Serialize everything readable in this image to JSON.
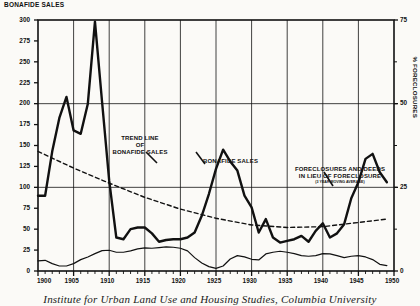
{
  "titles": {
    "left_axis": "BONAFIDE SALES",
    "right_axis": "% FORECLOSURES",
    "caption": "Institute for Urban Land Use and Housing Studies, Columbia University"
  },
  "annotations": {
    "trend_l1": "TREND LINE",
    "trend_l2": "OF",
    "trend_l3": "BONAFIDE SALES",
    "sales": "BONAFIDE SALES",
    "fore_l1": "FORECLOSURES AND DEEDS",
    "fore_l2": "IN LIEU OF FORECLOSURE",
    "fore_l3": "(3 YEAR MOVING AVERAGE)"
  },
  "chart_data": {
    "type": "line",
    "title": "",
    "xlabel": "",
    "ylabel": "BONAFIDE SALES",
    "y2label": "% FORECLOSURES",
    "xlim": [
      1900,
      1950
    ],
    "ylim": [
      0,
      300
    ],
    "y2lim": [
      0,
      75
    ],
    "grid": true,
    "legend": "annotations",
    "xticks": [
      1900,
      1905,
      1910,
      1915,
      1920,
      1925,
      1930,
      1935,
      1940,
      1945,
      1950
    ],
    "yticks": [
      0,
      25,
      50,
      75,
      100,
      125,
      150,
      175,
      200,
      225,
      250,
      275,
      300
    ],
    "y2ticks": [
      0,
      25,
      50,
      75
    ],
    "series": [
      {
        "name": "BONAFIDE SALES",
        "axis": "left",
        "style": "solid-thick",
        "color": "#111111",
        "x": [
          1900,
          1901,
          1902,
          1903,
          1904,
          1905,
          1906,
          1907,
          1908,
          1909,
          1910,
          1911,
          1912,
          1913,
          1914,
          1915,
          1916,
          1917,
          1918,
          1919,
          1920,
          1921,
          1922,
          1923,
          1924,
          1925,
          1926,
          1927,
          1928,
          1929,
          1930,
          1931,
          1932,
          1933,
          1934,
          1935,
          1936,
          1937,
          1938,
          1939,
          1940,
          1941,
          1942,
          1943,
          1944,
          1945,
          1946,
          1947,
          1948,
          1949
        ],
        "values": [
          90,
          90,
          143,
          183,
          208,
          168,
          164,
          200,
          298,
          202,
          108,
          40,
          38,
          50,
          52,
          52,
          45,
          35,
          37,
          38,
          38,
          40,
          46,
          66,
          92,
          122,
          145,
          131,
          120,
          90,
          76,
          46,
          62,
          40,
          34,
          36,
          38,
          42,
          35,
          48,
          57,
          40,
          45,
          56,
          87,
          106,
          134,
          140,
          118,
          106
        ]
      },
      {
        "name": "TREND LINE OF BONAFIDE SALES",
        "axis": "left",
        "style": "dashed",
        "color": "#111111",
        "x": [
          1900,
          1905,
          1910,
          1915,
          1920,
          1925,
          1930,
          1935,
          1940,
          1945,
          1949
        ],
        "values": [
          143,
          123,
          105,
          88,
          74,
          63,
          55,
          52,
          53,
          58,
          62
        ]
      },
      {
        "name": "FORECLOSURES AND DEEDS IN LIEU OF FORECLOSURE (3 YEAR MOVING AVERAGE)",
        "axis": "right",
        "style": "solid-thin",
        "color": "#111111",
        "x": [
          1900,
          1901,
          1902,
          1903,
          1904,
          1905,
          1906,
          1907,
          1908,
          1909,
          1910,
          1911,
          1912,
          1913,
          1914,
          1915,
          1916,
          1917,
          1918,
          1919,
          1920,
          1921,
          1922,
          1923,
          1924,
          1925,
          1926,
          1927,
          1928,
          1929,
          1930,
          1931,
          1932,
          1933,
          1934,
          1935,
          1936,
          1937,
          1938,
          1939,
          1940,
          1941,
          1942,
          1943,
          1944,
          1945,
          1946,
          1947,
          1948,
          1949
        ],
        "values": [
          3,
          3.2,
          2.2,
          1.5,
          1.5,
          2.2,
          3.4,
          4.2,
          5.2,
          6.1,
          6.2,
          5.6,
          5.6,
          6.0,
          6.6,
          6.9,
          6.8,
          7.0,
          7.2,
          7.1,
          6.8,
          6.0,
          4.0,
          2.4,
          1.3,
          0.8,
          1.5,
          3.6,
          4.6,
          4.2,
          3.5,
          3.3,
          5.1,
          5.6,
          5.9,
          5.6,
          5.2,
          4.6,
          4.4,
          4.6,
          5.2,
          5.1,
          4.6,
          4.0,
          4.4,
          4.6,
          4.2,
          3.4,
          2.0,
          1.6
        ]
      }
    ]
  }
}
